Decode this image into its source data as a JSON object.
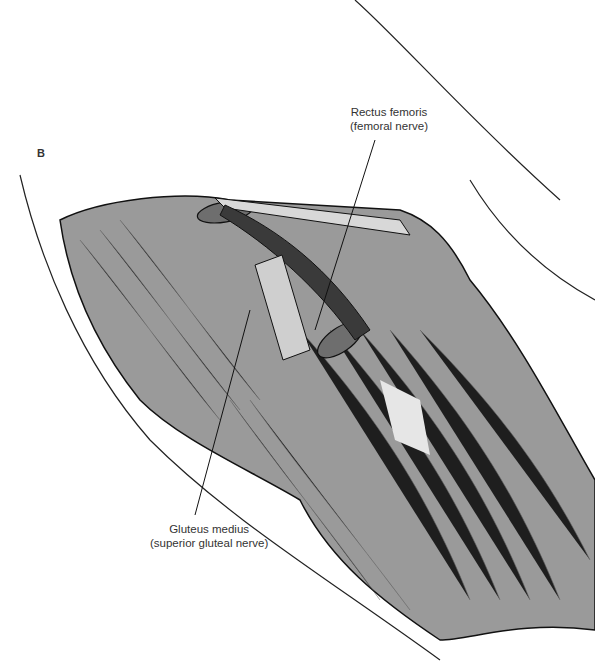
{
  "figure": {
    "panel_letter": "B",
    "labels": [
      {
        "line1": "Rectus femoris",
        "line2": "(femoral nerve)"
      },
      {
        "line1": "Gluteus medius",
        "line2": "(superior gluteal nerve)"
      }
    ],
    "colors": {
      "muscle": "#9a9a9a",
      "muscle_dark": "#6e6e6e",
      "tendon": "#d8d8d8",
      "vessel": "#3a3a3a",
      "outline": "#111111",
      "highlight": "#e6e6e6"
    }
  }
}
